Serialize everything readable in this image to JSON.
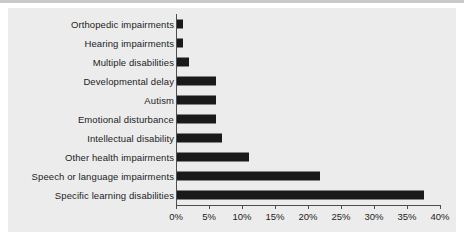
{
  "chart_data": {
    "type": "bar",
    "orientation": "horizontal",
    "title": "",
    "xlabel": "",
    "ylabel": "",
    "xlim": [
      0,
      40
    ],
    "grid": false,
    "legend": null,
    "bar_color": "#1a1a1a",
    "panel_color": "#ececec",
    "axis_color": "#4d4d4d",
    "tick_suffix": "%",
    "tick_values": [
      0,
      5,
      10,
      15,
      20,
      25,
      30,
      35,
      40
    ],
    "tick_labels": [
      "0%",
      "5%",
      "10%",
      "15%",
      "20%",
      "25%",
      "30%",
      "35%",
      "40%"
    ],
    "categories": [
      "Orthopedic impairments",
      "Hearing impairments",
      "Multiple disabilities",
      "Developmental delay",
      "Autism",
      "Emotional disturbance",
      "Intellectual disability",
      "Other health impairments",
      "Speech or language impairments",
      "Specific learning disabilities"
    ],
    "values": [
      1,
      1,
      2,
      6,
      6,
      6,
      7,
      11,
      21.8,
      37.5
    ]
  }
}
